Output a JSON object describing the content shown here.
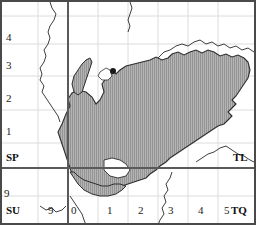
{
  "map": {
    "title": "Ordnance Survey grid map with shaded study area",
    "width": 256,
    "height": 225,
    "colors": {
      "background": "#ffffff",
      "frame": "#4a4a4a",
      "major_grid": "#5a5a5a",
      "minor_grid": "#d8d8d8",
      "coastline": "#3a3a3a",
      "shaded_fill": "#b0b0b0",
      "shaded_hatch": "#8c8c8c",
      "shaded_outline": "#2e2e2e",
      "marker": "#1a1a1a",
      "label_text": "#1a1a1a"
    }
  },
  "grid_squares": [
    {
      "code": "SP",
      "x": 6,
      "y": 158,
      "quadrant": "north-west"
    },
    {
      "code": "TL",
      "x": 233,
      "y": 158,
      "quadrant": "north-east"
    },
    {
      "code": "SU",
      "x": 6,
      "y": 211,
      "quadrant": "south-west"
    },
    {
      "code": "TQ",
      "x": 231,
      "y": 211,
      "quadrant": "south-east"
    }
  ],
  "easting_labels": [
    {
      "text": "9",
      "x": 4,
      "y": 193
    },
    {
      "text": "9",
      "x": 48,
      "y": 211
    },
    {
      "text": "0",
      "x": 71,
      "y": 211
    },
    {
      "text": "1",
      "x": 107,
      "y": 211
    },
    {
      "text": "2",
      "x": 138,
      "y": 211
    },
    {
      "text": "3",
      "x": 168,
      "y": 211
    },
    {
      "text": "4",
      "x": 198,
      "y": 211
    },
    {
      "text": "5",
      "x": 224,
      "y": 211
    }
  ],
  "northing_labels": [
    {
      "text": "4",
      "x": 6,
      "y": 32
    },
    {
      "text": "3",
      "x": 6,
      "y": 60
    },
    {
      "text": "2",
      "x": 6,
      "y": 93
    },
    {
      "text": "1",
      "x": 6,
      "y": 126
    }
  ],
  "major_gridlines": {
    "vertical_x": 68,
    "horizontal_y": 168
  },
  "minor_gridlines": {
    "vertical_x": [
      38,
      98,
      128,
      158,
      188,
      218
    ],
    "horizontal_y": [
      16,
      44,
      76,
      110,
      143,
      196
    ]
  },
  "marker": {
    "name": "city-point-marker",
    "x": 113,
    "y": 71,
    "radius": 3
  },
  "legend": {
    "shaded_area_note": "Hatched grey area indicates the mapped study region"
  }
}
